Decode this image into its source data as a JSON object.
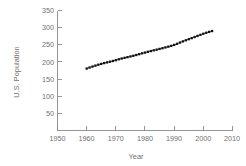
{
  "chart_data": {
    "type": "line",
    "title": "",
    "xlabel": "Year",
    "ylabel": "U.S. Population",
    "xlim": [
      1950,
      2010
    ],
    "ylim": [
      0,
      350
    ],
    "xticks": [
      1950,
      1960,
      1970,
      1980,
      1990,
      2000,
      2010
    ],
    "xtick_labels": [
      "1950",
      "1960",
      "1970",
      "1980",
      "1990",
      "2000",
      "2010"
    ],
    "yticks": [
      50,
      100,
      150,
      200,
      250,
      300,
      350
    ],
    "ytick_labels": [
      "50",
      "100",
      "150",
      "200",
      "250",
      "300",
      "350"
    ],
    "grid": false,
    "legend": "none",
    "marker": "square",
    "series": [
      {
        "name": "U.S. Population",
        "x": [
          1960,
          1961,
          1962,
          1963,
          1964,
          1965,
          1966,
          1967,
          1968,
          1969,
          1970,
          1971,
          1972,
          1973,
          1974,
          1975,
          1976,
          1977,
          1978,
          1979,
          1980,
          1981,
          1982,
          1983,
          1984,
          1985,
          1986,
          1987,
          1988,
          1989,
          1990,
          1991,
          1992,
          1993,
          1994,
          1995,
          1996,
          1997,
          1998,
          1999,
          2000,
          2001,
          2002,
          2003
        ],
        "values": [
          180.7,
          183.7,
          186.5,
          189.2,
          191.9,
          194.3,
          196.6,
          198.7,
          200.7,
          202.7,
          205.1,
          207.7,
          209.9,
          211.9,
          213.9,
          216.0,
          218.0,
          220.2,
          222.6,
          225.1,
          227.2,
          229.5,
          231.7,
          233.8,
          235.8,
          237.9,
          240.1,
          242.3,
          244.5,
          246.8,
          249.6,
          252.9,
          256.5,
          259.9,
          263.1,
          266.3,
          269.4,
          272.6,
          275.9,
          279.0,
          282.2,
          285.1,
          287.6,
          290.1
        ]
      }
    ]
  },
  "axes": {
    "x_title": "Year",
    "y_title": "U.S. Population"
  }
}
